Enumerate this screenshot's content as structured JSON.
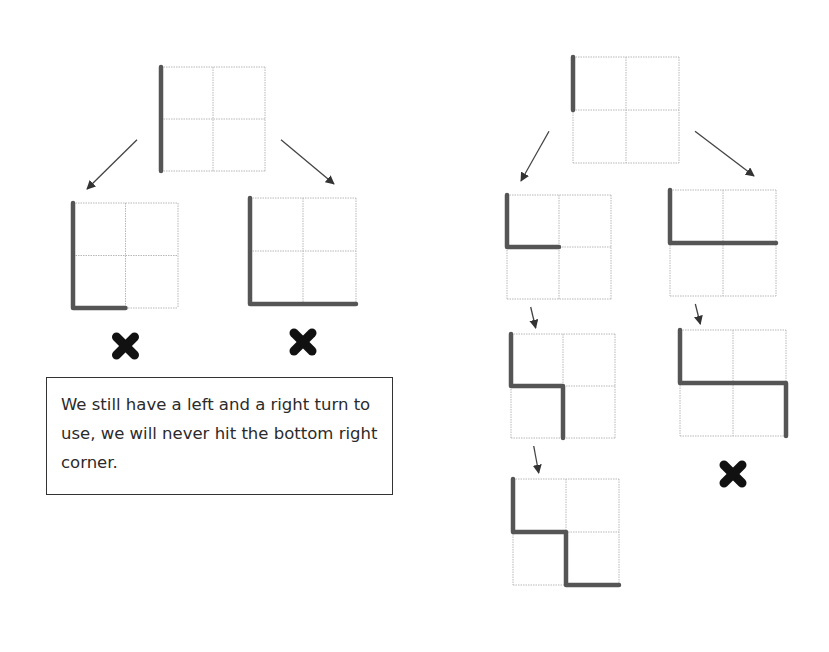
{
  "note": {
    "text": "We still have a left and a right turn to use, we will never hit the bottom right corner."
  },
  "diagram": {
    "grid_size": 2,
    "colors": {
      "path": "#555555",
      "grid": "#b8b8b8",
      "arrow": "#444444",
      "cross": "#111111"
    },
    "grids": [
      {
        "id": "left-root",
        "path": [
          [
            0,
            0
          ],
          [
            0,
            2
          ]
        ],
        "marker": null
      },
      {
        "id": "left-child-a",
        "path": [
          [
            0,
            0
          ],
          [
            0,
            2
          ],
          [
            1,
            2
          ]
        ],
        "marker": "cross"
      },
      {
        "id": "left-child-b",
        "path": [
          [
            0,
            0
          ],
          [
            0,
            2
          ],
          [
            2,
            2
          ]
        ],
        "marker": "cross"
      },
      {
        "id": "right-root",
        "path": [
          [
            0,
            0
          ],
          [
            0,
            1
          ]
        ],
        "marker": null
      },
      {
        "id": "right-child-a",
        "path": [
          [
            0,
            0
          ],
          [
            0,
            1
          ],
          [
            1,
            1
          ]
        ],
        "marker": null
      },
      {
        "id": "right-child-b",
        "path": [
          [
            0,
            0
          ],
          [
            0,
            1
          ],
          [
            2,
            1
          ]
        ],
        "marker": null
      },
      {
        "id": "right-grandchild-a",
        "path": [
          [
            0,
            0
          ],
          [
            0,
            1
          ],
          [
            1,
            1
          ],
          [
            1,
            2
          ]
        ],
        "marker": null
      },
      {
        "id": "right-grandchild-b",
        "path": [
          [
            0,
            0
          ],
          [
            0,
            1
          ],
          [
            2,
            1
          ],
          [
            2,
            2
          ]
        ],
        "marker": "cross"
      },
      {
        "id": "right-great-grandchild-a",
        "path": [
          [
            0,
            0
          ],
          [
            0,
            1
          ],
          [
            1,
            1
          ],
          [
            1,
            2
          ],
          [
            2,
            2
          ]
        ],
        "marker": null
      }
    ],
    "arrows": [
      {
        "from": "left-root",
        "to": "left-child-a"
      },
      {
        "from": "left-root",
        "to": "left-child-b"
      },
      {
        "from": "right-root",
        "to": "right-child-a"
      },
      {
        "from": "right-root",
        "to": "right-child-b"
      },
      {
        "from": "right-child-a",
        "to": "right-grandchild-a"
      },
      {
        "from": "right-child-b",
        "to": "right-grandchild-b"
      },
      {
        "from": "right-grandchild-a",
        "to": "right-great-grandchild-a"
      }
    ]
  }
}
